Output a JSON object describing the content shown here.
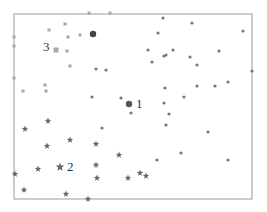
{
  "chart_data": {
    "type": "scatter",
    "title": "",
    "xlabel": "",
    "ylabel": "",
    "grid": false,
    "legend": null,
    "frame": {
      "left": 14,
      "top": 14,
      "right": 252,
      "bottom": 199,
      "color": "#9a9a9a"
    },
    "series": [
      {
        "name": "cluster-3",
        "marker": "square",
        "color": "#a8a8a8",
        "label": "3",
        "centroid": {
          "x": 56,
          "y": 50
        },
        "points": [
          {
            "x": 14,
            "y": 37
          },
          {
            "x": 14,
            "y": 46
          },
          {
            "x": 14,
            "y": 78
          },
          {
            "x": 49,
            "y": 30
          },
          {
            "x": 65,
            "y": 24
          },
          {
            "x": 68,
            "y": 37
          },
          {
            "x": 80,
            "y": 35
          },
          {
            "x": 67,
            "y": 51
          },
          {
            "x": 46,
            "y": 91
          },
          {
            "x": 23,
            "y": 91
          },
          {
            "x": 45,
            "y": 85
          },
          {
            "x": 70,
            "y": 66
          },
          {
            "x": 89,
            "y": 13
          },
          {
            "x": 110,
            "y": 13
          }
        ]
      },
      {
        "name": "cluster-1",
        "marker": "dot",
        "color": "#777777",
        "label": "1",
        "centroid": {
          "x": 129,
          "y": 104
        },
        "points": [
          {
            "x": 93,
            "y": 34
          },
          {
            "x": 96,
            "y": 69
          },
          {
            "x": 106,
            "y": 70
          },
          {
            "x": 92,
            "y": 97
          },
          {
            "x": 121,
            "y": 98
          },
          {
            "x": 163,
            "y": 18
          },
          {
            "x": 192,
            "y": 23
          },
          {
            "x": 243,
            "y": 31
          },
          {
            "x": 158,
            "y": 33
          },
          {
            "x": 148,
            "y": 50
          },
          {
            "x": 164,
            "y": 56
          },
          {
            "x": 166,
            "y": 55
          },
          {
            "x": 173,
            "y": 50
          },
          {
            "x": 152,
            "y": 62
          },
          {
            "x": 190,
            "y": 57
          },
          {
            "x": 197,
            "y": 65
          },
          {
            "x": 219,
            "y": 51
          },
          {
            "x": 252,
            "y": 71
          },
          {
            "x": 197,
            "y": 86
          },
          {
            "x": 215,
            "y": 86
          },
          {
            "x": 228,
            "y": 82
          },
          {
            "x": 165,
            "y": 88
          },
          {
            "x": 184,
            "y": 97
          },
          {
            "x": 164,
            "y": 103
          },
          {
            "x": 169,
            "y": 114
          },
          {
            "x": 166,
            "y": 125
          },
          {
            "x": 208,
            "y": 132
          },
          {
            "x": 157,
            "y": 160
          },
          {
            "x": 181,
            "y": 153
          },
          {
            "x": 228,
            "y": 160
          },
          {
            "x": 131,
            "y": 113
          },
          {
            "x": 102,
            "y": 128
          }
        ]
      },
      {
        "name": "cluster-2",
        "marker": "star",
        "color": "#666666",
        "label": "2",
        "centroid": {
          "x": 60,
          "y": 167
        },
        "points": [
          {
            "x": 25,
            "y": 129
          },
          {
            "x": 48,
            "y": 121
          },
          {
            "x": 47,
            "y": 146
          },
          {
            "x": 70,
            "y": 140
          },
          {
            "x": 38,
            "y": 169
          },
          {
            "x": 15,
            "y": 174
          },
          {
            "x": 96,
            "y": 165
          },
          {
            "x": 97,
            "y": 178
          },
          {
            "x": 24,
            "y": 190
          },
          {
            "x": 66,
            "y": 194
          },
          {
            "x": 88,
            "y": 199
          },
          {
            "x": 119,
            "y": 155
          },
          {
            "x": 128,
            "y": 178
          },
          {
            "x": 140,
            "y": 173
          },
          {
            "x": 146,
            "y": 176
          },
          {
            "x": 96,
            "y": 144
          }
        ]
      }
    ]
  }
}
